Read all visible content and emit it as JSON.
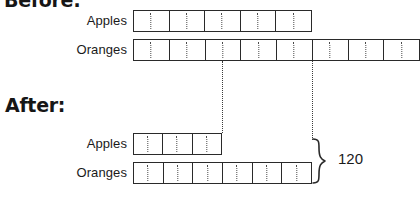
{
  "diagram": {
    "title_before": "Before:",
    "title_after": "After:",
    "brace_label": "120",
    "colors": {
      "ink": "#2a2a2a",
      "dotted": "#4a4a4a",
      "background": "#ffffff"
    },
    "sections": [
      {
        "id": "before",
        "heading": "Before:",
        "rows": [
          {
            "id": "before-apples",
            "label": "Apples",
            "segments": 5,
            "bar_left": 133,
            "bar_right": 312,
            "bar_top": 10,
            "bar_height": 22
          },
          {
            "id": "before-oranges",
            "label": "Oranges",
            "segments": 8,
            "bar_left": 133,
            "bar_right": 420,
            "bar_top": 39,
            "bar_height": 22
          }
        ]
      },
      {
        "id": "after",
        "heading": "After:",
        "rows": [
          {
            "id": "after-apples",
            "label": "Apples",
            "segments": 3,
            "bar_left": 133,
            "bar_right": 222,
            "bar_top": 133,
            "bar_height": 22
          },
          {
            "id": "after-oranges",
            "label": "Oranges",
            "segments": 6,
            "bar_left": 133,
            "bar_right": 312,
            "bar_top": 162,
            "bar_height": 22
          }
        ]
      }
    ],
    "connectors": [
      {
        "id": "connector-left",
        "x": 222,
        "y_top": 61,
        "y_bottom": 133
      },
      {
        "id": "connector-right",
        "x": 312,
        "y_top": 61,
        "y_bottom": 140
      }
    ]
  }
}
